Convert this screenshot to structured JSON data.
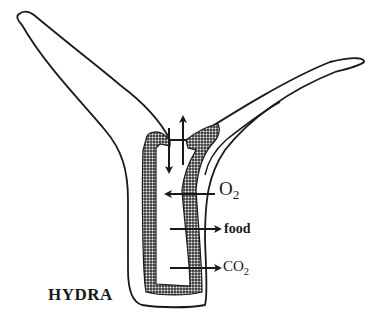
{
  "title": "HYDRA",
  "labels": {
    "o2": {
      "main": "O",
      "sub": "2"
    },
    "food": "food",
    "co2": {
      "main": "CO",
      "sub": "2"
    }
  },
  "colors": {
    "line": "#1a1a1a",
    "background": "#ffffff",
    "stipple": "#3a3a3a"
  },
  "arrows": [
    {
      "id": "water-in",
      "direction": "down"
    },
    {
      "id": "water-out",
      "direction": "up"
    },
    {
      "id": "o2-arrow",
      "direction": "left",
      "label": "O2"
    },
    {
      "id": "food-arrow",
      "direction": "right",
      "label": "food"
    },
    {
      "id": "co2-arrow",
      "direction": "right",
      "label": "CO2"
    }
  ]
}
